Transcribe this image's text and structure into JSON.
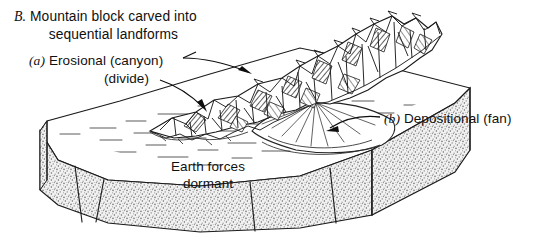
{
  "figure": {
    "panel_letter": "B.",
    "title_line1": "Mountain block carved into",
    "title_line2": "sequential landforms",
    "labels": {
      "a_marker": "(a)",
      "a_text": " Erosional (canyon)",
      "a_sub": "(divide)",
      "b_marker": "(b)",
      "b_text": " Depositional (fan)",
      "dormant_line1": "Earth forces",
      "dormant_line2": "dormant"
    },
    "colors": {
      "ink": "#101010",
      "background": "#ffffff",
      "stipple": "#8a8a8a",
      "rock_shadow": "#9a9a9a",
      "plain_line": "#4a4a4a"
    },
    "elements": {
      "block": "3d-block-diagram",
      "mountain": "eroded-mountain-range",
      "fan": "alluvial-fan",
      "plain": "flat-plain-surface",
      "front_face": "stippled-block-front-face",
      "right_face": "stippled-block-right-face"
    }
  }
}
